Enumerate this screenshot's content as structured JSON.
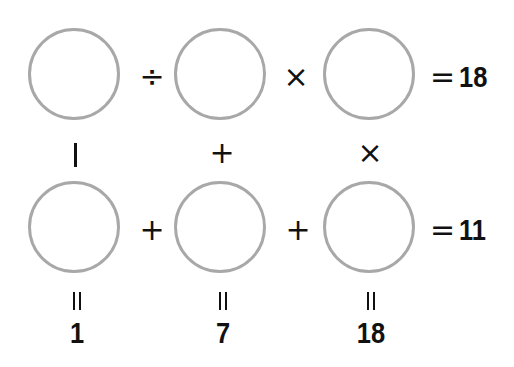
{
  "puzzle": {
    "row1": {
      "operators": [
        "÷",
        "×"
      ],
      "equals": "=",
      "result": "18"
    },
    "row2": {
      "operators": [
        "+",
        "+"
      ],
      "equals": "=",
      "result": "11"
    },
    "column_operators": [
      "−",
      "+",
      "×"
    ],
    "column_equals": [
      "=",
      "=",
      "="
    ],
    "column_results": [
      "1",
      "7",
      "18"
    ]
  }
}
